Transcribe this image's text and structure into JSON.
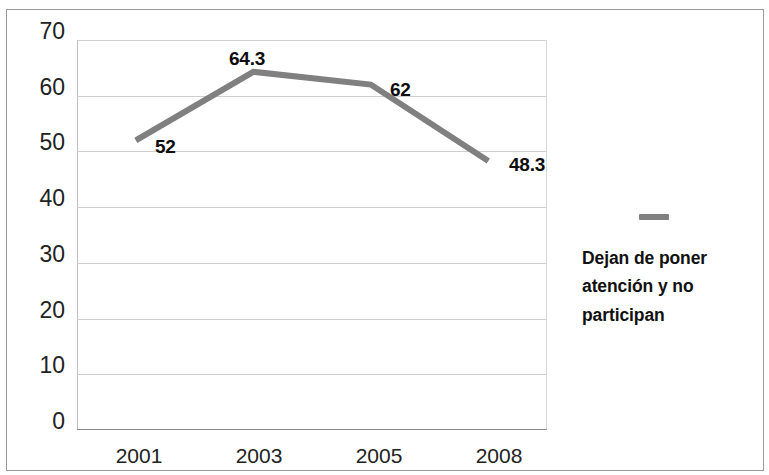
{
  "chart_data": {
    "type": "line",
    "title": "",
    "subtitle": "",
    "xlabel": "",
    "ylabel": "",
    "categories": [
      "2001",
      "2003",
      "2005",
      "2008"
    ],
    "series": [
      {
        "name": "Dejan de poner atención y no participan",
        "values": [
          52,
          64.3,
          62,
          48.3
        ],
        "labels": [
          "52",
          "64.3",
          "62",
          "48.3"
        ],
        "color": "#808080"
      }
    ],
    "ylim": [
      0,
      70
    ],
    "yticks": [
      "0",
      "10",
      "20",
      "30",
      "40",
      "50",
      "60",
      "70"
    ],
    "ytick_values": [
      0,
      10,
      20,
      30,
      40,
      50,
      60,
      70
    ],
    "grid": true,
    "legend_position": "right",
    "marker_style": "none",
    "line_width": 6
  },
  "legend": {
    "entries": [
      {
        "label_line1": "Dejan de poner",
        "label_line2": "atención y no",
        "label_line3": "participan",
        "full_label": "Dejan de poner atención y no participan",
        "marker_color": "#808080"
      }
    ]
  },
  "axes": {
    "y": {
      "ticks": [
        {
          "label": "70",
          "value": 70
        },
        {
          "label": "60",
          "value": 60
        },
        {
          "label": "50",
          "value": 50
        },
        {
          "label": "40",
          "value": 40
        },
        {
          "label": "30",
          "value": 30
        },
        {
          "label": "20",
          "value": 20
        },
        {
          "label": "10",
          "value": 10
        },
        {
          "label": "0",
          "value": 0
        }
      ]
    },
    "x": {
      "ticks": [
        {
          "label": "2001"
        },
        {
          "label": "2003"
        },
        {
          "label": "2005"
        },
        {
          "label": "2008"
        }
      ]
    }
  },
  "data_labels": [
    {
      "text": "52"
    },
    {
      "text": "64.3"
    },
    {
      "text": "62"
    },
    {
      "text": "48.3"
    }
  ],
  "colors": {
    "series_line": "#808080",
    "gridline": "#cfcfcf",
    "frame_border": "#9a9a9a",
    "text": "#1a1a1a",
    "background": "#ffffff"
  }
}
